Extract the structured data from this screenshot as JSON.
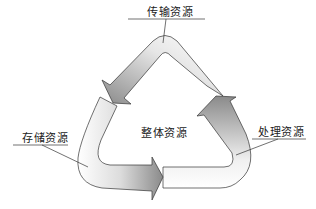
{
  "diagram": {
    "center_label": "整体资源",
    "cycle": [
      {
        "id": "transmission",
        "label": "传输资源",
        "position": "top"
      },
      {
        "id": "processing",
        "label": "处理资源",
        "position": "right"
      },
      {
        "id": "storage",
        "label": "存储资源",
        "position": "left"
      }
    ],
    "flow": [
      "处理资源 → 传输资源",
      "传输资源 → 存储资源",
      "存储资源 → 处理资源"
    ],
    "colors": {
      "stroke": "#333333",
      "gradient_dark": "#8a8a8a",
      "gradient_light": "#ffffff"
    }
  }
}
